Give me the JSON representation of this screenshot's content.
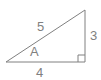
{
  "figure": {
    "kind": "right-triangle-diagram",
    "background_color": "#ffffff",
    "stroke_color": "#808080",
    "text_color": "#808080",
    "stroke_width": 1,
    "labels": {
      "hypotenuse": "5",
      "vertical_leg": "3",
      "base_leg": "4",
      "angle": "A"
    },
    "geometry": {
      "vertex_left": {
        "x": 6,
        "y": 62
      },
      "vertex_bottom_right": {
        "x": 85,
        "y": 62
      },
      "vertex_top_right": {
        "x": 85,
        "y": 10
      },
      "right_angle_marker": {
        "x": 78,
        "y": 55,
        "size": 7
      },
      "points_path": "6,62 85,62 85,10"
    }
  }
}
